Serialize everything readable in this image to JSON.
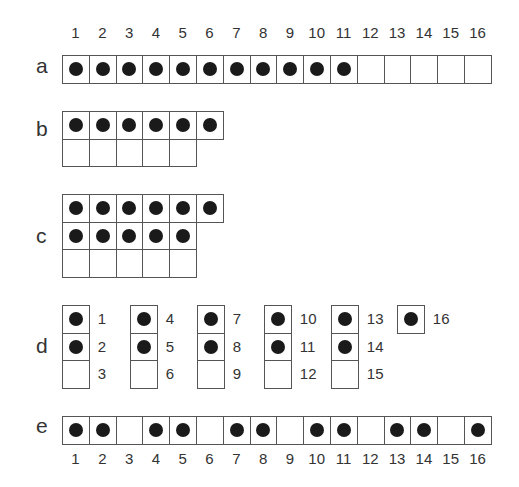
{
  "figure": {
    "top_numbers": [
      "1",
      "2",
      "3",
      "4",
      "5",
      "6",
      "7",
      "8",
      "9",
      "10",
      "11",
      "12",
      "13",
      "14",
      "15",
      "16"
    ],
    "bottom_numbers": [
      "1",
      "2",
      "3",
      "4",
      "5",
      "6",
      "7",
      "8",
      "9",
      "10",
      "11",
      "12",
      "13",
      "14",
      "15",
      "16"
    ],
    "rows": [
      {
        "label": "a",
        "description": "single row of 16 cells, first 11 filled"
      },
      {
        "label": "b",
        "description": "two rows: 6 cells filled on top, 5 empty below"
      },
      {
        "label": "c",
        "description": "three rows: 6 filled, 5 filled, 5 empty"
      },
      {
        "label": "d",
        "description": "groups of three stacked cells numbered 1-15, plus cell 16"
      },
      {
        "label": "e",
        "description": "single row of 16 cells, every third cell empty"
      }
    ],
    "row_a_filled": [
      1,
      1,
      1,
      1,
      1,
      1,
      1,
      1,
      1,
      1,
      1,
      0,
      0,
      0,
      0,
      0
    ],
    "row_b_grid": [
      [
        1,
        1,
        1,
        1,
        1,
        1
      ],
      [
        0,
        0,
        0,
        0,
        0
      ]
    ],
    "row_c_grid": [
      [
        1,
        1,
        1,
        1,
        1,
        1
      ],
      [
        1,
        1,
        1,
        1,
        1
      ],
      [
        0,
        0,
        0,
        0,
        0
      ]
    ],
    "row_d_groups": [
      {
        "numbers": [
          "1",
          "2",
          "3"
        ],
        "filled": [
          1,
          1,
          0
        ]
      },
      {
        "numbers": [
          "4",
          "5",
          "6"
        ],
        "filled": [
          1,
          1,
          0
        ]
      },
      {
        "numbers": [
          "7",
          "8",
          "9"
        ],
        "filled": [
          1,
          1,
          0
        ]
      },
      {
        "numbers": [
          "10",
          "11",
          "12"
        ],
        "filled": [
          1,
          1,
          0
        ]
      },
      {
        "numbers": [
          "13",
          "14",
          "15"
        ],
        "filled": [
          1,
          1,
          0
        ]
      },
      {
        "numbers": [
          "16"
        ],
        "filled": [
          1
        ]
      }
    ],
    "row_e_filled": [
      1,
      1,
      0,
      1,
      1,
      0,
      1,
      1,
      0,
      1,
      1,
      0,
      1,
      1,
      0,
      1
    ],
    "dot_color": "#1a1a1a",
    "border_color": "#555555"
  }
}
